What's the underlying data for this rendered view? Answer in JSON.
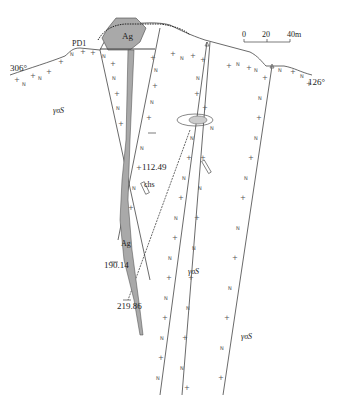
{
  "diagram": {
    "type": "geological-cross-section",
    "scale_bar": {
      "ticks": [
        "0",
        "20",
        "40m"
      ]
    },
    "orientation": {
      "left": "306°",
      "right": "126°"
    },
    "labels": {
      "ore_body_top": "Ag",
      "ore_body_lower": "Ag",
      "adit": "PD1",
      "alteration": "chs",
      "rock_unit_left": "γσS",
      "rock_unit_center": "γσS",
      "rock_unit_right": "γσS"
    },
    "drillholes": [
      {
        "depth": "112.49"
      },
      {
        "depth": "190.14"
      },
      {
        "depth": "219.86"
      }
    ],
    "colors": {
      "ore": "#a9a9a9",
      "line": "#444444",
      "symbol": "#555555",
      "background": "#ffffff"
    }
  }
}
